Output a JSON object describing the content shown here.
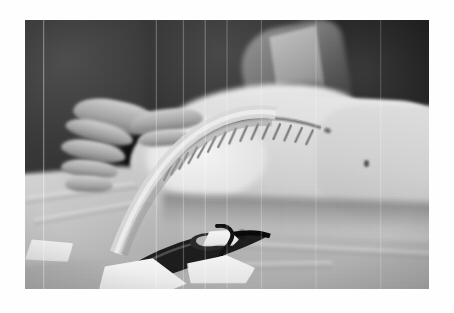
{
  "page": {
    "background_color": "#ffffff",
    "width": 454,
    "height": 313
  },
  "photograph": {
    "name": "intraoperative-clinical-photograph",
    "description": "Grayscale intraoperative clinical photograph of a patient on an operating table",
    "frame": {
      "left": 25,
      "top": 20,
      "width": 404,
      "height": 269,
      "border_color": "#ffffff"
    },
    "color_mode": "grayscale",
    "tones": {
      "darkest": "#0d0d0d",
      "shadow": "#2a2a2a",
      "midtone": "#7d7d7d",
      "skin_light": "#e6e6e6",
      "highlight": "#f4f4f4",
      "drape": "#bdbdbd"
    },
    "artifacts": {
      "type": "vertical-scan-lines",
      "count": 8,
      "color": "#ebebeb",
      "grain": true,
      "vignette": true
    },
    "regions": [
      {
        "name": "surgeon-left",
        "label": "Dark-gowned surgeon at left of frame",
        "tone": "#3b3b3b"
      },
      {
        "name": "surgeon-gown-highlight",
        "label": "Lit surgical gown shoulder, upper right of centre",
        "tone": "#9a9a9a"
      },
      {
        "name": "dark-background-right",
        "label": "Deep shadow background at upper right",
        "tone": "#1b1b1b"
      },
      {
        "name": "gloved-hands",
        "label": "Gloved fingers of assistant at left holding equipment",
        "tone": "#a8a8a8"
      },
      {
        "name": "patient-limb",
        "label": "Pale patient limb / torso running left to right across frame",
        "tone": "#dcdcdc"
      },
      {
        "name": "suture-line",
        "label": "Closed surgical incision with interrupted suture marks along limb",
        "tone": "#6a6a6a"
      },
      {
        "name": "tubing",
        "label": "Curved translucent tubing descending from hands to lower left",
        "tone": "#c8c8c8"
      },
      {
        "name": "surgical-instrument",
        "label": "Dark metal surgical instrument resting on drape, lower left",
        "tone": "#151515"
      },
      {
        "name": "surgical-drapes",
        "label": "Light grey surgical drapes and sheeting across lower half",
        "tone": "#bdbdbd"
      },
      {
        "name": "gauze-papers",
        "label": "White gauze and paper fragments on drape, lower centre",
        "tone": "#f2f2f2"
      },
      {
        "name": "skin-marks",
        "label": "Small dark skin markings on the pale limb",
        "tone": "#585858"
      }
    ]
  }
}
